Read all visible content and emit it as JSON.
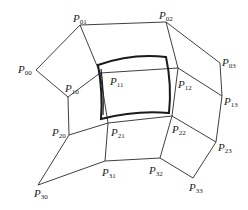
{
  "diagram": {
    "title": "",
    "control_points": [
      {
        "id": "P00",
        "base": "P",
        "sub": "00",
        "x": 36,
        "y": 70,
        "lx": 18,
        "ly": 64
      },
      {
        "id": "P01",
        "base": "P",
        "sub": "01",
        "x": 80,
        "y": 25,
        "lx": 73,
        "ly": 13
      },
      {
        "id": "P02",
        "base": "P",
        "sub": "02",
        "x": 166,
        "y": 22,
        "lx": 159,
        "ly": 10
      },
      {
        "id": "P03",
        "base": "P",
        "sub": "03",
        "x": 220,
        "y": 63,
        "lx": 222,
        "ly": 57
      },
      {
        "id": "P10",
        "base": "P",
        "sub": "10",
        "x": 68,
        "y": 97,
        "lx": 65,
        "ly": 83
      },
      {
        "id": "P11",
        "base": "P",
        "sub": "11",
        "x": 100,
        "y": 73,
        "lx": 110,
        "ly": 76
      },
      {
        "id": "P12",
        "base": "P",
        "sub": "12",
        "x": 178,
        "y": 68,
        "lx": 178,
        "ly": 79
      },
      {
        "id": "P13",
        "base": "P",
        "sub": "13",
        "x": 222,
        "y": 96,
        "lx": 224,
        "ly": 96
      },
      {
        "id": "P20",
        "base": "P",
        "sub": "20",
        "x": 69,
        "y": 135,
        "lx": 52,
        "ly": 127
      },
      {
        "id": "P21",
        "base": "P",
        "sub": "21",
        "x": 108,
        "y": 123,
        "lx": 111,
        "ly": 127
      },
      {
        "id": "P22",
        "base": "P",
        "sub": "22",
        "x": 172,
        "y": 116,
        "lx": 172,
        "ly": 124
      },
      {
        "id": "P23",
        "base": "P",
        "sub": "23",
        "x": 216,
        "y": 142,
        "lx": 218,
        "ly": 142
      },
      {
        "id": "P30",
        "base": "P",
        "sub": "30",
        "x": 38,
        "y": 185,
        "lx": 34,
        "ly": 188
      },
      {
        "id": "P31",
        "base": "P",
        "sub": "31",
        "x": 105,
        "y": 161,
        "lx": 102,
        "ly": 167
      },
      {
        "id": "P32",
        "base": "P",
        "sub": "32",
        "x": 160,
        "y": 158,
        "lx": 149,
        "ly": 165
      },
      {
        "id": "P33",
        "base": "P",
        "sub": "33",
        "x": 193,
        "y": 178,
        "lx": 189,
        "ly": 182
      }
    ],
    "edges": [
      [
        "P00",
        "P01"
      ],
      [
        "P01",
        "P02"
      ],
      [
        "P02",
        "P03"
      ],
      [
        "P10",
        "P11"
      ],
      [
        "P11",
        "P12"
      ],
      [
        "P12",
        "P13"
      ],
      [
        "P20",
        "P21"
      ],
      [
        "P21",
        "P22"
      ],
      [
        "P22",
        "P23"
      ],
      [
        "P30",
        "P31"
      ],
      [
        "P31",
        "P32"
      ],
      [
        "P32",
        "P33"
      ],
      [
        "P00",
        "P10"
      ],
      [
        "P10",
        "P20"
      ],
      [
        "P20",
        "P30"
      ],
      [
        "P01",
        "P11"
      ],
      [
        "P11",
        "P21"
      ],
      [
        "P21",
        "P31"
      ],
      [
        "P02",
        "P12"
      ],
      [
        "P12",
        "P22"
      ],
      [
        "P22",
        "P32"
      ],
      [
        "P03",
        "P13"
      ],
      [
        "P13",
        "P23"
      ],
      [
        "P23",
        "P33"
      ]
    ],
    "patch": {
      "description": "Bicubic surface patch (bold curved quadrilateral) defined by the 4x4 control net",
      "path": "M98,65 Q132,53 166,57 Q172,85 169,113 Q136,110 101,119 Q103,92 98,65 Z",
      "inner_path": "M101,69 Q104,92 103,115"
    },
    "colors": {
      "edge": "#2a2a2a",
      "patch": "#1a1a1a",
      "background": "#ffffff"
    }
  }
}
